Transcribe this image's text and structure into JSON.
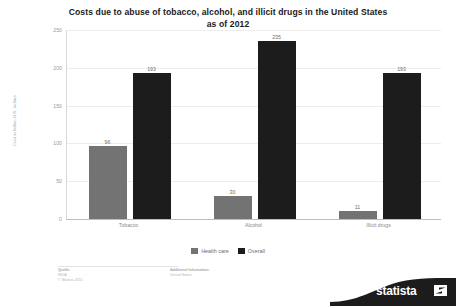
{
  "chart_data": {
    "type": "bar",
    "title": "Costs due to abuse of tobacco, alcohol, and illicit drugs in the United States as of 2012",
    "title_line1": "Costs due to abuse of tobacco, alcohol, and illicit drugs in the United States",
    "title_line2": "as of 2012",
    "xlabel": "",
    "ylabel": "Cost in billion U.S. dollars",
    "ylim": [
      0,
      250
    ],
    "yticks": [
      0,
      50,
      100,
      150,
      200,
      250
    ],
    "grid": true,
    "legend_position": "bottom",
    "categories": [
      "Tobacco",
      "Alcohol",
      "Illicit drugs"
    ],
    "series": [
      {
        "name": "Health care",
        "color": "#737373",
        "values": [
          96,
          30,
          11
        ]
      },
      {
        "name": "Overall",
        "color": "#1c1c1c",
        "values": [
          193,
          235,
          193
        ]
      }
    ]
  },
  "footer": {
    "source": {
      "head": "Quelle:",
      "lines": [
        "NIDA",
        "© Statista 2015"
      ]
    },
    "additional": {
      "head": "Additional Information:",
      "lines": [
        "United States"
      ]
    }
  },
  "logo": {
    "text": "statista",
    "mark": "statista-arrow-mark"
  }
}
